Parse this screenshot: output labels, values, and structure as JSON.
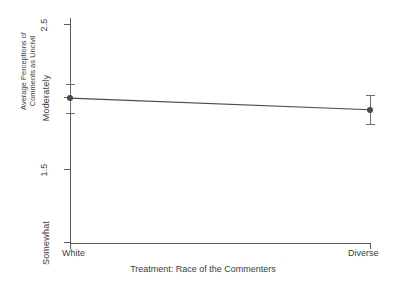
{
  "chart_data": {
    "type": "line",
    "title": "",
    "xlabel": "Treatment: Race of the Commenters",
    "ylabel": "Average Perceptions of Comments as Uncivil",
    "ylabel_lines": [
      "Average Perceptions of",
      "Comments as Uncivil"
    ],
    "categories": [
      "White",
      "Diverse"
    ],
    "x": [
      0,
      1
    ],
    "values": [
      1.99,
      1.91
    ],
    "error_low": [
      1.89,
      1.81
    ],
    "error_high": [
      2.09,
      2.01
    ],
    "ylim": [
      1.0,
      2.5
    ],
    "xlim": [
      -0.12,
      1.12
    ],
    "grid": false,
    "legend": "none",
    "y_ticks": [
      {
        "value": 2.5,
        "label": "2.5"
      },
      {
        "value": 2.0,
        "label": "Moderately"
      },
      {
        "value": 1.5,
        "label": "1.5"
      },
      {
        "value": 1.0,
        "label": "Somewhat"
      }
    ],
    "x_ticks": [
      {
        "value": 0,
        "label": "White"
      },
      {
        "value": 1,
        "label": "Diverse"
      }
    ],
    "series": [
      {
        "name": "Average Perceptions of Comments as Uncivil",
        "values": [
          1.99,
          1.91
        ]
      }
    ],
    "colors": {
      "line": "#4a4a4a",
      "marker": "#4a4a4a",
      "error_bar": "#6e6e6e",
      "axis": "#5a5a5a",
      "text": "#3d3d3d",
      "background": "#ffffff"
    }
  }
}
